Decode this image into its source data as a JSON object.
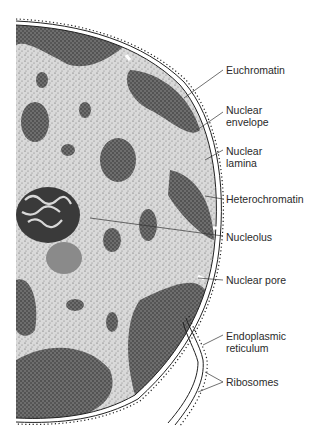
{
  "diagram": {
    "labels": [
      {
        "id": "euchromatin",
        "text": "Euchromatin",
        "x": 226,
        "y": 64,
        "line": [
          [
            223,
            70
          ],
          [
            184,
            98
          ]
        ]
      },
      {
        "id": "nuclear-envelope",
        "text": "Nuclear\nenvelope",
        "x": 226,
        "y": 104,
        "line": [
          [
            223,
            112
          ],
          [
            197,
            130
          ]
        ]
      },
      {
        "id": "nuclear-lamina",
        "text": "Nuclear\nlamina",
        "x": 226,
        "y": 145,
        "line": [
          [
            223,
            150
          ],
          [
            205,
            160
          ]
        ]
      },
      {
        "id": "heterochromatin",
        "text": "Heterochromatin",
        "x": 226,
        "y": 193,
        "line": [
          [
            223,
            199
          ],
          [
            205,
            196
          ]
        ]
      },
      {
        "id": "nucleolus",
        "text": "Nucleolus",
        "x": 226,
        "y": 231,
        "line": [
          [
            223,
            236
          ],
          [
            90,
            218
          ]
        ]
      },
      {
        "id": "nuclear-pore",
        "text": "Nuclear pore",
        "x": 226,
        "y": 274,
        "line": [
          [
            223,
            280
          ],
          [
            198,
            278
          ]
        ]
      },
      {
        "id": "endoplasmic-reticulum",
        "text": "Endoplasmic\nreticulum",
        "x": 226,
        "y": 330,
        "line": [
          [
            223,
            335
          ],
          [
            203,
            345
          ]
        ]
      },
      {
        "id": "ribosomes",
        "text": "Ribosomes",
        "x": 226,
        "y": 376,
        "lines": [
          [
            [
              223,
              382
            ],
            [
              205,
              372
            ]
          ],
          [
            [
              223,
              382
            ],
            [
              198,
              392
            ]
          ]
        ]
      }
    ]
  }
}
